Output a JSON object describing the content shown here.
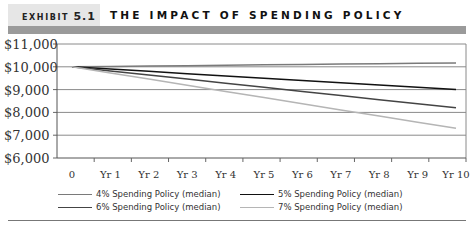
{
  "header": {
    "exhibit_label": "EXHIBIT",
    "exhibit_number": "5.1",
    "title": "THE IMPACT OF SPENDING POLICY"
  },
  "chart_data": {
    "type": "line",
    "title": "The Impact of Spending Policy",
    "xlabel": "",
    "ylabel": "",
    "categories": [
      "0",
      "Yr 1",
      "Yr 2",
      "Yr 3",
      "Yr 4",
      "Yr 5",
      "Yr 6",
      "Yr 7",
      "Yr 8",
      "Yr 9",
      "Yr 10"
    ],
    "y_tick_labels": [
      "$11,000",
      "$10,000",
      "$9,000",
      "$8,000",
      "$7,000",
      "$6,000"
    ],
    "ylim": [
      6000,
      11000
    ],
    "grid": true,
    "legend_position": "bottom",
    "series": [
      {
        "name": "4% Spending Policy (median)",
        "color": "#7a7a7a",
        "values": [
          10000,
          10017,
          10034,
          10051,
          10068,
          10085,
          10102,
          10119,
          10136,
          10153,
          10170
        ]
      },
      {
        "name": "5% Spending Policy (median)",
        "color": "#111111",
        "values": [
          10000,
          9900,
          9800,
          9700,
          9600,
          9500,
          9400,
          9300,
          9200,
          9100,
          9000
        ]
      },
      {
        "name": "6% Spending Policy (median)",
        "color": "#444444",
        "values": [
          10000,
          9820,
          9640,
          9460,
          9280,
          9100,
          8920,
          8740,
          8560,
          8380,
          8200
        ]
      },
      {
        "name": "7% Spending Policy (median)",
        "color": "#b5b5b5",
        "values": [
          10000,
          9730,
          9460,
          9190,
          8920,
          8650,
          8380,
          8110,
          7840,
          7570,
          7300
        ]
      }
    ]
  },
  "legend": {
    "items": [
      {
        "label": "4% Spending Policy (median)",
        "color": "#7a7a7a"
      },
      {
        "label": "5% Spending Policy (median)",
        "color": "#111111"
      },
      {
        "label": "6% Spending Policy (median)",
        "color": "#444444"
      },
      {
        "label": "7% Spending Policy (median)",
        "color": "#b5b5b5"
      }
    ]
  }
}
